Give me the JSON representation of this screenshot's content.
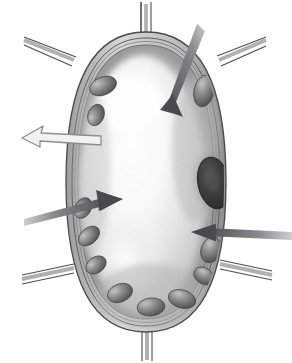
{
  "figure": {
    "title": "Plant cell cross-section diagram",
    "background_color": "#ffffff",
    "width": 292,
    "height": 363,
    "style": "grayscale pencil/airbrush biological illustration"
  },
  "colors": {
    "background": "#ffffff",
    "wall_line": "#4a4a4a",
    "wall_fill": "#c9c9c9",
    "wall_shadow": "#8f8f8f",
    "cytoplasm_light": "#f4f4f4",
    "cytoplasm_mid": "#d2d2d2",
    "cytoplasm_dark": "#a8a8a8",
    "vacuole_highlight": "#fdfdfd",
    "chloroplast_dark": "#5c5c5c",
    "chloroplast_mid": "#8a8a8a",
    "chloroplast_light": "#b9b9b9",
    "nucleus_dark": "#3a3a3a",
    "nucleus_edge": "#2c2c2c",
    "arrow_solid": "#58585a",
    "arrow_solid_tail": "#b8b8bc",
    "arrow_hollow_line": "#9a9a9e",
    "arrow_hollow_fill": "#eeeeee"
  },
  "cell": {
    "label": "plant-cell",
    "outline": {
      "cx": 146,
      "cy": 182,
      "rx": 78,
      "ry": 147
    },
    "wall": {
      "label": "cell-wall",
      "layer_count": 3,
      "thickness_px": 7
    },
    "membrane": {
      "label": "cell-membrane",
      "inset_px": 9
    },
    "vacuole": {
      "label": "central-vacuole",
      "cx": 140,
      "cy": 185,
      "rx": 56,
      "ry": 120
    },
    "nucleus": {
      "label": "nucleus",
      "cx": 214,
      "cy": 183,
      "rx": 16,
      "ry": 26,
      "rotation": -12
    }
  },
  "wall_junctions": [
    {
      "name": "junction-top-center",
      "x": 146,
      "y": 34,
      "angle": 90
    },
    {
      "name": "junction-upper-left",
      "x": 72,
      "y": 64,
      "angle": 200
    },
    {
      "name": "junction-upper-right",
      "x": 221,
      "y": 64,
      "angle": 340
    },
    {
      "name": "junction-lower-left",
      "x": 70,
      "y": 272,
      "angle": 165
    },
    {
      "name": "junction-lower-right",
      "x": 224,
      "y": 268,
      "angle": 15
    },
    {
      "name": "junction-bottom-center",
      "x": 147,
      "y": 330,
      "angle": 270
    }
  ],
  "chloroplasts": [
    {
      "id": 1,
      "cx": 103,
      "cy": 86,
      "rx": 14,
      "ry": 9,
      "rot": -22
    },
    {
      "id": 2,
      "cx": 96,
      "cy": 115,
      "rx": 11,
      "ry": 8,
      "rot": -70
    },
    {
      "id": 3,
      "cx": 204,
      "cy": 91,
      "rx": 10,
      "ry": 16,
      "rot": 12
    },
    {
      "id": 4,
      "cx": 89,
      "cy": 236,
      "rx": 12,
      "ry": 8,
      "rot": -40
    },
    {
      "id": 5,
      "cx": 96,
      "cy": 265,
      "rx": 11,
      "ry": 8,
      "rot": -35
    },
    {
      "id": 6,
      "cx": 120,
      "cy": 293,
      "rx": 13,
      "ry": 9,
      "rot": -22
    },
    {
      "id": 7,
      "cx": 151,
      "cy": 307,
      "rx": 14,
      "ry": 9,
      "rot": -6
    },
    {
      "id": 8,
      "cx": 182,
      "cy": 299,
      "rx": 14,
      "ry": 9,
      "rot": 16
    },
    {
      "id": 9,
      "cx": 204,
      "cy": 276,
      "rx": 11,
      "ry": 8,
      "rot": 32
    },
    {
      "id": 10,
      "cx": 211,
      "cy": 250,
      "rx": 10,
      "ry": 13,
      "rot": 20
    },
    {
      "id": 11,
      "cx": 83,
      "cy": 208,
      "rx": 11,
      "ry": 8,
      "rot": -60
    }
  ],
  "arrows": [
    {
      "name": "arrow-to-cell-wall",
      "style": "solid",
      "direction": "down-left",
      "tail": {
        "x": 196,
        "y": 26
      },
      "head": {
        "x": 165,
        "y": 108
      },
      "points_at": "cell wall / membrane at top of cell",
      "color": "#58585a"
    },
    {
      "name": "arrow-out-of-cell",
      "style": "hollow",
      "direction": "left",
      "tail": {
        "x": 98,
        "y": 142
      },
      "head": {
        "x": 12,
        "y": 133
      },
      "points_at": "outward through the cell wall",
      "color": "#9a9a9e"
    },
    {
      "name": "arrow-to-vacuole",
      "style": "solid",
      "direction": "up-right",
      "tail": {
        "x": 25,
        "y": 222
      },
      "head": {
        "x": 121,
        "y": 199
      },
      "points_at": "central vacuole",
      "color": "#58585a"
    },
    {
      "name": "arrow-to-nucleus",
      "style": "solid",
      "direction": "left",
      "tail": {
        "x": 290,
        "y": 236
      },
      "head": {
        "x": 192,
        "y": 231
      },
      "points_at": "nucleus region",
      "color": "#58585a"
    }
  ]
}
